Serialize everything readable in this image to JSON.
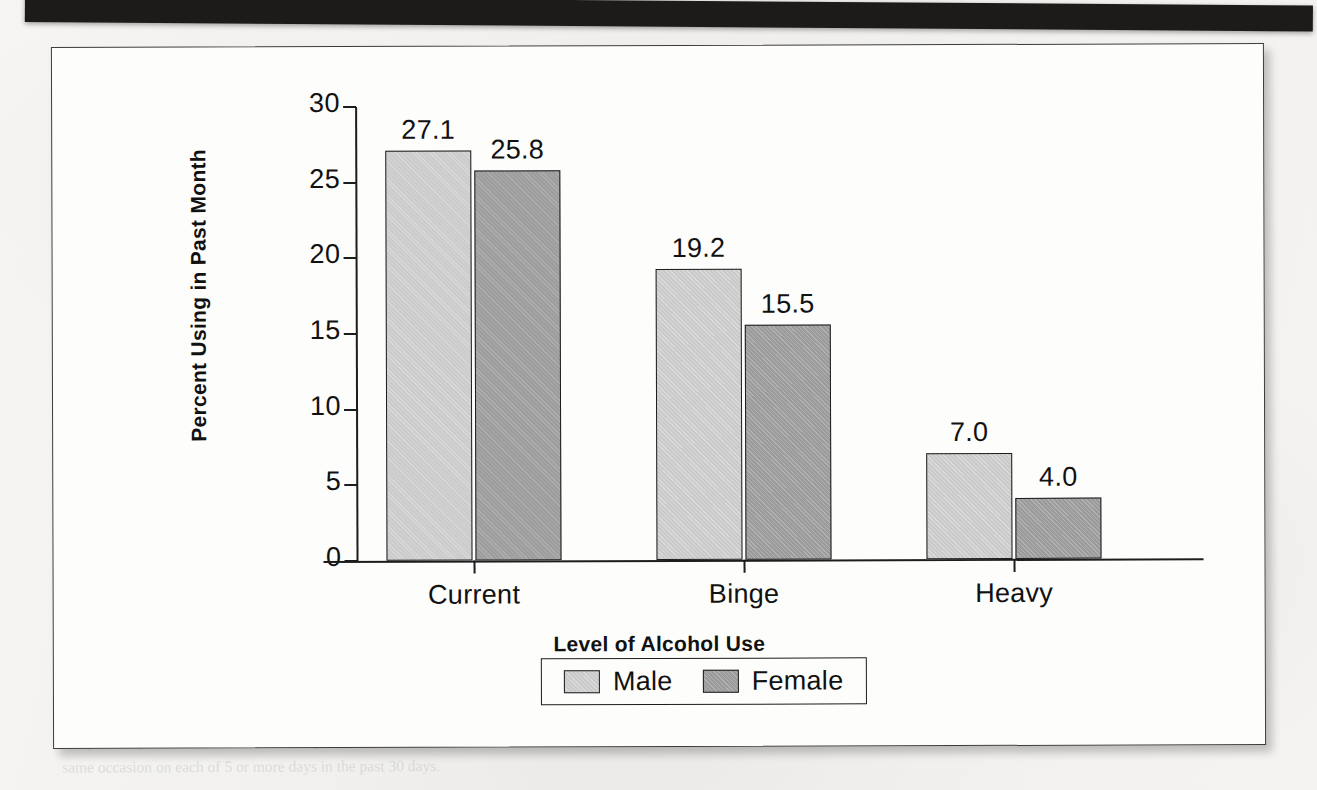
{
  "page": {
    "background_color": "#f3f2f0",
    "header_band_color": "#1c1b1a",
    "header_band_text": "",
    "ghost_text_right": "the cases of alcohol use in the past month. Overall, 25.8\npercent of adults in the U.S. reported a binge episode of alcohol\nconsumption and drinking in the past month and 7.0 percent\nreported heavy drinking in a 30-day period.\n\nPrevalence of alcohol use and use disorders varies substantially\nacross age groups. In 2002, use of alcohol in the past month was\nreported by 28.8 percent of youths aged 12 to 17, 60.5 percent of\nyoung adults aged 18 to 25, and 54.9 percent of adults aged 26\nand older. Binge alcohol use was reported by 10.7 percent of youths\naged 12 to 17, 40.9 percent of young adults, and 21.1 percent of\nadults aged 26 and older.\n\nRates of binge and heavy alcohol use were highest among persons\naged 18 to 25, peaking at age 21. Among young adults aged 18 to 25\nin 2002, 41.4 percent reported binge drinking in the past month.\n\nAmong pregnant women aged 15 to 44, an estimated 9.1 percent reported\nalcohol use in the past month, 3.1 percent reported binge drinking,\nand 0.7 percent reported heavy drinking in the past 30 days.",
    "ghost_text_left": "    use\n in the\n  past",
    "ghost_text_bottom": "Binge drinking is defined as drinking five or more drinks on the same occasion on at least\n1 day in the past 30 days. Heavy drinking is defined as drinking five or more drinks on the\nsame occasion on each of 5 or more days in the past 30 days."
  },
  "chart_data": {
    "type": "bar",
    "title": "",
    "subtitle": "",
    "xlabel": "Level of Alcohol Use",
    "ylabel": "Percent Using in Past Month",
    "categories": [
      "Current",
      "Binge",
      "Heavy"
    ],
    "series": [
      {
        "name": "Male",
        "color": "#cacaca",
        "values": [
          27.1,
          19.2,
          7.0
        ]
      },
      {
        "name": "Female",
        "color": "#9b9b9b",
        "values": [
          25.8,
          15.5,
          4.0
        ]
      }
    ],
    "value_labels": [
      [
        "27.1",
        "25.8"
      ],
      [
        "19.2",
        "15.5"
      ],
      [
        "7.0",
        "4.0"
      ]
    ],
    "ylim": [
      0,
      30
    ],
    "ytick_values": [
      0,
      5,
      10,
      15,
      20,
      25,
      30
    ],
    "ytick_labels": [
      "0",
      "5",
      "10",
      "15",
      "20",
      "25",
      "30"
    ],
    "grid": false,
    "legend_position": "bottom",
    "legend_entries": [
      "Male",
      "Female"
    ],
    "axis_color": "#1d1d1d",
    "plot_background": "#fdfdfc"
  }
}
